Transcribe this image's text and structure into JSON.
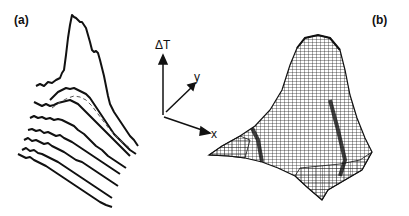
{
  "panels": {
    "a": {
      "label": "(a)",
      "description": "Stacked noisy temperature-difference traces; top trace shows a pronounced peak, dashed reference curve among lower traces"
    },
    "b": {
      "label": "(b)",
      "description": "3D wireframe mesh surface with a single peak"
    }
  },
  "axes": {
    "vertical": "ΔT",
    "depth": "y",
    "horizontal": "x"
  },
  "colors": {
    "ink": "#111111",
    "background": "#ffffff"
  }
}
